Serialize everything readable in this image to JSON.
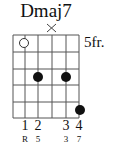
{
  "chord": {
    "name": "Dmaj7",
    "fret_label": "5fr.",
    "strings": 6,
    "frets": 5,
    "muted_strings": [
      4
    ],
    "open_markers": [
      {
        "string": 2,
        "fret": 1
      }
    ],
    "dots": [
      {
        "string": 3,
        "fret": 3
      },
      {
        "string": 5,
        "fret": 3
      },
      {
        "string": 6,
        "fret": 5
      }
    ],
    "fingers": [
      {
        "string": 2,
        "label": "1",
        "interval": "R"
      },
      {
        "string": 3,
        "label": "2",
        "interval": "5"
      },
      {
        "string": 5,
        "label": "3",
        "interval": "3"
      },
      {
        "string": 6,
        "label": "4",
        "interval": "7"
      }
    ]
  },
  "colors": {
    "line": "#555555",
    "dot": "#111111",
    "background": "#ffffff"
  }
}
